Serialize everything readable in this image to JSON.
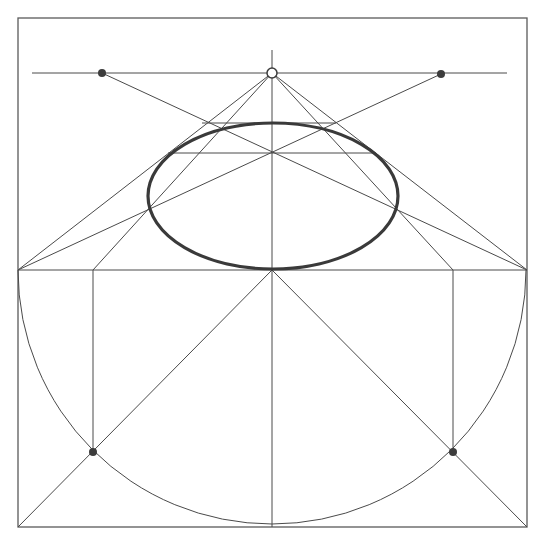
{
  "diagram": {
    "type": "perspective-circle-construction",
    "colors": {
      "line": "#4a4a4a",
      "frame": "#5a5a5a",
      "ellipse": "#3a3a3a",
      "dot": "#3c3c3c",
      "background": "#ffffff"
    },
    "frame": {
      "x": 18,
      "y": 18,
      "width": 509,
      "height": 509
    },
    "horizon": {
      "y": 73,
      "x1": 32,
      "x2": 507
    },
    "vanishing_point": {
      "x": 272,
      "y": 73,
      "style": "open"
    },
    "distance_points": [
      {
        "x": 102,
        "y": 73
      },
      {
        "x": 441,
        "y": 74
      }
    ],
    "ground_line": {
      "y": 270,
      "x1": 18,
      "x2": 527
    },
    "center_vertical": {
      "x": 272,
      "y1": 50,
      "y2": 527
    },
    "ellipse": {
      "cx": 273,
      "cy": 196,
      "rx": 125,
      "ry": 73
    },
    "semicircle": {
      "cx": 272,
      "cy": 270,
      "r": 254
    },
    "lower_dots": [
      {
        "x": 93,
        "y": 452
      },
      {
        "x": 453,
        "y": 452
      }
    ],
    "lines": [
      {
        "x1": 272,
        "y1": 73,
        "x2": 18,
        "y2": 270
      },
      {
        "x1": 272,
        "y1": 73,
        "x2": 93,
        "y2": 270
      },
      {
        "x1": 272,
        "y1": 73,
        "x2": 453,
        "y2": 270
      },
      {
        "x1": 272,
        "y1": 73,
        "x2": 527,
        "y2": 270
      },
      {
        "x1": 102,
        "y1": 73,
        "x2": 527,
        "y2": 270
      },
      {
        "x1": 441,
        "y1": 74,
        "x2": 18,
        "y2": 270
      },
      {
        "x1": 202,
        "y1": 123,
        "x2": 336,
        "y2": 123
      },
      {
        "x1": 168,
        "y1": 153,
        "x2": 376,
        "y2": 153
      },
      {
        "x1": 93,
        "y1": 270,
        "x2": 93,
        "y2": 452
      },
      {
        "x1": 453,
        "y1": 270,
        "x2": 453,
        "y2": 452
      },
      {
        "x1": 272,
        "y1": 270,
        "x2": 18,
        "y2": 527
      },
      {
        "x1": 272,
        "y1": 270,
        "x2": 527,
        "y2": 527
      }
    ]
  }
}
